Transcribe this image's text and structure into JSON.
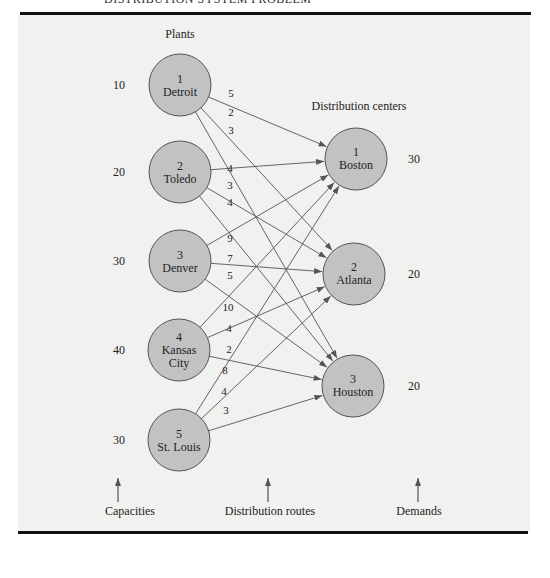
{
  "header": {
    "title": "DISTRIBUTION SYSTEM PROBLEM"
  },
  "labels": {
    "plants": "Plants",
    "distribution_centers": "Distribution centers",
    "capacities": "Capacities",
    "distribution_routes": "Distribution routes",
    "demands": "Demands"
  },
  "plants": [
    {
      "id": "1",
      "name": "Detroit",
      "capacity": "10"
    },
    {
      "id": "2",
      "name": "Toledo",
      "capacity": "20"
    },
    {
      "id": "3",
      "name": "Denver",
      "capacity": "30"
    },
    {
      "id": "4",
      "name": "Kansas City",
      "capacity": "40"
    },
    {
      "id": "5",
      "name": "St. Louis",
      "capacity": "30"
    }
  ],
  "centers": [
    {
      "id": "1",
      "name": "Boston",
      "demand": "30"
    },
    {
      "id": "2",
      "name": "Atlanta",
      "demand": "20"
    },
    {
      "id": "3",
      "name": "Houston",
      "demand": "20"
    }
  ],
  "routes": [
    {
      "from": 0,
      "to": 0,
      "cost": "5"
    },
    {
      "from": 0,
      "to": 1,
      "cost": "2"
    },
    {
      "from": 0,
      "to": 2,
      "cost": "3"
    },
    {
      "from": 1,
      "to": 0,
      "cost": "4"
    },
    {
      "from": 1,
      "to": 1,
      "cost": "3"
    },
    {
      "from": 1,
      "to": 2,
      "cost": "4"
    },
    {
      "from": 2,
      "to": 0,
      "cost": "9"
    },
    {
      "from": 2,
      "to": 1,
      "cost": "7"
    },
    {
      "from": 2,
      "to": 2,
      "cost": "5"
    },
    {
      "from": 3,
      "to": 0,
      "cost": "10"
    },
    {
      "from": 3,
      "to": 1,
      "cost": "4"
    },
    {
      "from": 3,
      "to": 2,
      "cost": "2"
    },
    {
      "from": 4,
      "to": 0,
      "cost": "8"
    },
    {
      "from": 4,
      "to": 1,
      "cost": "4"
    },
    {
      "from": 4,
      "to": 2,
      "cost": "3"
    }
  ],
  "colors": {
    "node_fill": "#c2c2c2",
    "panel": "#f1f1f0",
    "rule": "#111111"
  }
}
